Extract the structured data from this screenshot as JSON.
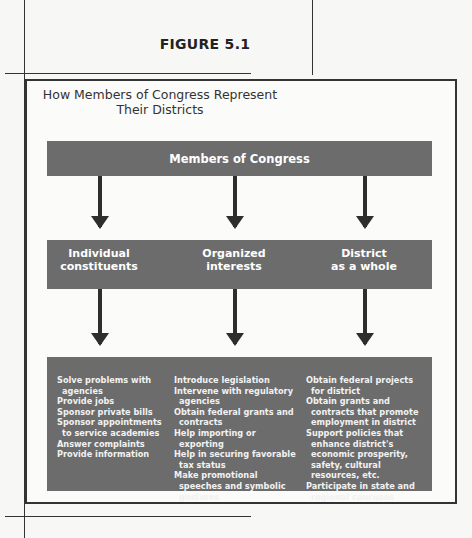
{
  "figure": {
    "label": "FIGURE 5.1",
    "title_line1": "How Members of Congress Represent",
    "title_line2": "Their Districts"
  },
  "diagram": {
    "top": {
      "label": "Members of Congress"
    },
    "middle": [
      {
        "line1": "Individual",
        "line2": "constituents"
      },
      {
        "line1": "Organized",
        "line2": "interests"
      },
      {
        "line1": "District",
        "line2": "as a whole"
      }
    ],
    "bottom": [
      {
        "items": [
          "Solve problems with agencies",
          "Provide jobs",
          "Sponsor private bills",
          "Sponsor appointments to service academies",
          "Answer complaints",
          "Provide information"
        ]
      },
      {
        "items": [
          "Introduce legislation",
          "Intervene with regulatory agencies",
          "Obtain federal grants and contracts",
          "Help importing or exporting",
          "Help in securing favorable tax status",
          "Make promotional speeches and symbolic gestures"
        ]
      },
      {
        "items": [
          "Obtain federal projects for district",
          "Obtain grants and contracts that promote employment in district",
          "Support policies that enhance district's economic prosperity, safety, cultural resources, etc.",
          "Participate in state and regional caucuses"
        ]
      }
    ],
    "colors": {
      "box_fill": "#6c6c6c",
      "arrow": "#2e2e2e",
      "frame": "#333333"
    }
  }
}
